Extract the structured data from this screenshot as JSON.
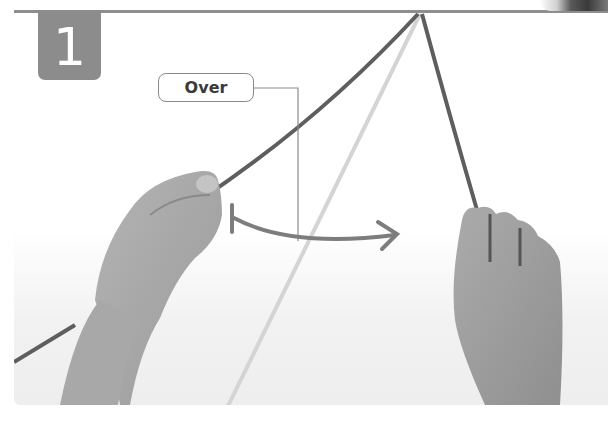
{
  "figure": {
    "step_number": "1",
    "callout": {
      "label": "Over"
    },
    "colors": {
      "badge": "#8c8c8c",
      "top_rule": "#8e8e8e",
      "rope_dark": "#5e5e5e",
      "rope_light": "#d4d4d4",
      "arrow": "#7d7d7d",
      "skin": "#a6a6a6",
      "callout_border": "#8a8a8a",
      "callout_text": "#3a3a3a"
    }
  }
}
